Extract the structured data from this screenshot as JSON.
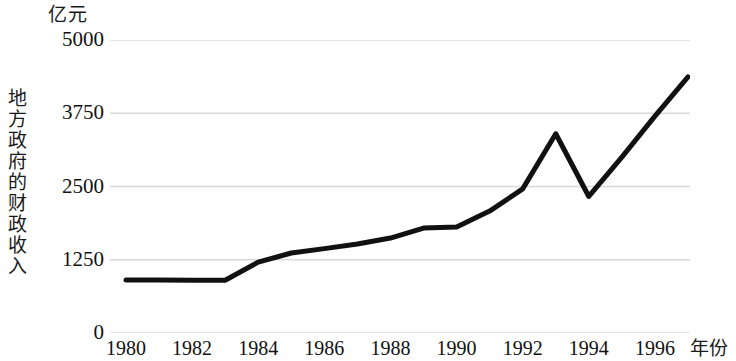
{
  "chart_data": {
    "type": "line",
    "title": "",
    "subtitle": "",
    "xlabel": "年份",
    "ylabel": "地方政府的财政收入",
    "yunit": "亿元",
    "x": [
      1980,
      1981,
      1982,
      1983,
      1984,
      1985,
      1986,
      1987,
      1988,
      1989,
      1990,
      1991,
      1992,
      1993,
      1994,
      1995,
      1996,
      1997
    ],
    "values": [
      905,
      905,
      900,
      900,
      1210,
      1365,
      1440,
      1520,
      1620,
      1790,
      1810,
      2080,
      2460,
      3400,
      2330,
      3000,
      3700,
      4370
    ],
    "series": [
      {
        "name": "地方政府的财政收入",
        "values": [
          905,
          905,
          900,
          900,
          1210,
          1365,
          1440,
          1520,
          1620,
          1790,
          1810,
          2080,
          2460,
          3400,
          2330,
          3000,
          3700,
          4370
        ]
      }
    ],
    "xlim": [
      1980,
      1997
    ],
    "ylim": [
      0,
      5000
    ],
    "xticks": [
      1980,
      1982,
      1984,
      1986,
      1988,
      1990,
      1992,
      1994,
      1996
    ],
    "xticklabels": [
      "1980",
      "1982",
      "1984",
      "1986",
      "1988",
      "1990",
      "1992",
      "1994",
      "1996"
    ],
    "yticks": [
      0,
      1250,
      2500,
      3750,
      5000
    ],
    "yticklabels": [
      "0",
      "1250",
      "2500",
      "3750",
      "5000"
    ],
    "grid": "horizontal",
    "legend": "none",
    "line_color": "#111111",
    "line_width": 5,
    "grid_color": "#d8d8d8",
    "background": "#ffffff"
  }
}
